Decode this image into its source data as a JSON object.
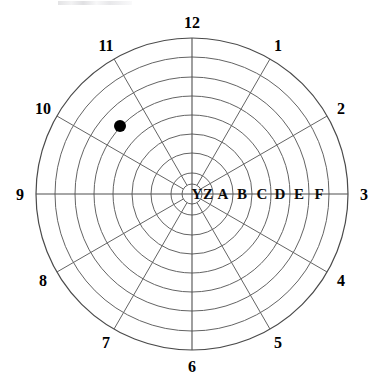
{
  "figure": {
    "title": "",
    "background_color": "#ffffff",
    "line_color": "#646464",
    "label_color": "#000000",
    "marker_color": "#000000"
  },
  "chart_data": {
    "type": "scatter",
    "coordinate_system": "polar",
    "title": "",
    "xlabel": "",
    "ylabel": "",
    "grid": true,
    "legend": "none",
    "center": {
      "x": 192,
      "y": 194
    },
    "outer_radius": 156,
    "angular_axis": {
      "name": "clock-hours",
      "unit": "hour",
      "count": 12,
      "tick_labels": [
        "12",
        "1",
        "2",
        "3",
        "4",
        "5",
        "6",
        "7",
        "8",
        "9",
        "10",
        "11"
      ],
      "tick_angles_deg": [
        0,
        30,
        60,
        90,
        120,
        150,
        180,
        210,
        240,
        270,
        300,
        330
      ],
      "label_radius": 172
    },
    "radial_axis": {
      "name": "zone-rings",
      "tick_labels": [
        "Y",
        "Z",
        "A",
        "B",
        "C",
        "D",
        "E",
        "F"
      ],
      "ring_outer_radii": [
        10,
        21,
        41,
        60,
        79,
        98,
        117,
        137,
        156
      ],
      "label_radii": [
        5,
        16,
        31,
        50,
        70,
        88,
        107,
        127,
        146
      ],
      "label_angle_deg": 90
    },
    "series": [
      {
        "name": "data-point",
        "marker": "filled-circle",
        "marker_radius_px": 6,
        "color": "#000000",
        "points": [
          {
            "label": "",
            "angle_hour": 10.55,
            "angle_deg": 316.5,
            "radius_px": 101,
            "ring": "D",
            "pixel": {
              "x": 120,
              "y": 126
            }
          }
        ]
      }
    ]
  },
  "hour_labels": [
    {
      "text": "12",
      "angle_deg": 0
    },
    {
      "text": "1",
      "angle_deg": 30
    },
    {
      "text": "2",
      "angle_deg": 60
    },
    {
      "text": "3",
      "angle_deg": 90
    },
    {
      "text": "4",
      "angle_deg": 120
    },
    {
      "text": "5",
      "angle_deg": 150
    },
    {
      "text": "6",
      "angle_deg": 180
    },
    {
      "text": "7",
      "angle_deg": 210
    },
    {
      "text": "8",
      "angle_deg": 240
    },
    {
      "text": "9",
      "angle_deg": 270
    },
    {
      "text": "10",
      "angle_deg": 300
    },
    {
      "text": "11",
      "angle_deg": 330
    }
  ],
  "ring_labels": [
    {
      "text": "Y",
      "radius": 5
    },
    {
      "text": "Z",
      "radius": 16
    },
    {
      "text": "A",
      "radius": 31
    },
    {
      "text": "B",
      "radius": 50
    },
    {
      "text": "C",
      "radius": 70
    },
    {
      "text": "D",
      "radius": 88
    },
    {
      "text": "E",
      "radius": 107
    },
    {
      "text": "F",
      "radius": 127
    }
  ]
}
